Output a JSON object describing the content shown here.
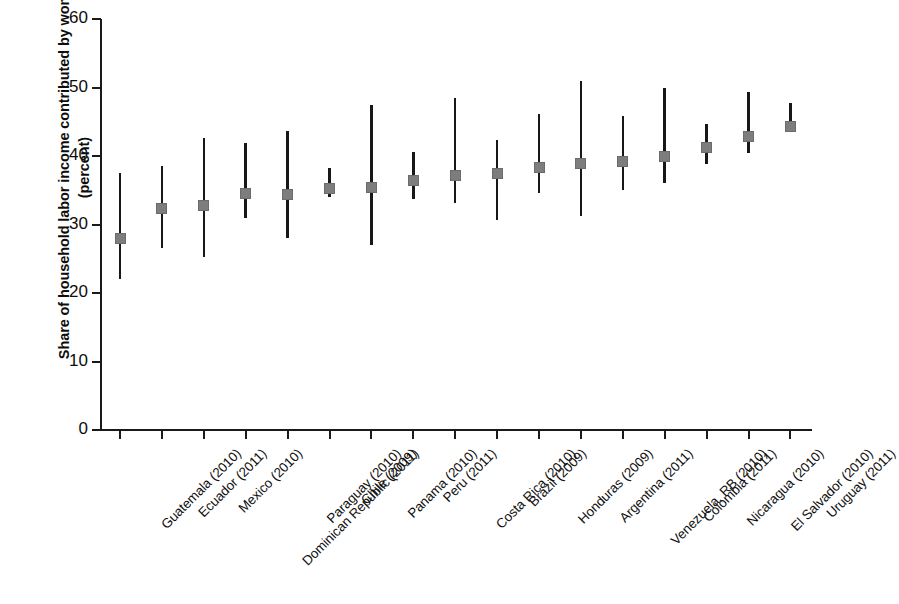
{
  "chart_data": {
    "type": "scatter",
    "title": "",
    "subtitle": "",
    "xlabel": "",
    "ylabel": "Share of household labor income contributed by women (percent)",
    "ylim": [
      0,
      60
    ],
    "ytick_labels": [
      "0",
      "10",
      "20",
      "30",
      "40",
      "50",
      "60"
    ],
    "yticks": [
      0,
      10,
      20,
      30,
      40,
      50,
      60
    ],
    "grid": false,
    "legend": null,
    "legend_position": "none",
    "annotations": [],
    "marker_style": "grey square with vertical range line",
    "categories": [
      "Guatemala (2010)",
      "Ecuador (2011)",
      "Mexico (2010)",
      "Dominican Republic (2011)",
      "Paraguay (2010)",
      "Chile (2009)",
      "Panama (2010)",
      "Peru (2011)",
      "Costa Rica (2010)",
      "Brazil (2009)",
      "Honduras (2009)",
      "Argentina (2011)",
      "Venezuela, RB (2010)",
      "Colombia (2011)",
      "Nicaragua (2010)",
      "El Salvador (2010)",
      "Uruguay (2011)"
    ],
    "series": [
      {
        "name": "Mean share",
        "values": [
          28.0,
          32.3,
          32.8,
          34.5,
          34.4,
          35.2,
          35.4,
          36.4,
          37.2,
          37.4,
          38.3,
          38.9,
          39.2,
          39.9,
          41.3,
          42.8,
          44.3
        ]
      },
      {
        "name": "Range low",
        "values": [
          22.0,
          26.5,
          25.3,
          30.9,
          28.1,
          34.0,
          27.0,
          33.7,
          33.1,
          30.6,
          34.6,
          31.3,
          35.0,
          36.0,
          38.8,
          40.5,
          43.5
        ]
      },
      {
        "name": "Range high",
        "values": [
          37.5,
          38.6,
          42.7,
          41.9,
          43.6,
          38.3,
          47.4,
          40.6,
          48.4,
          42.3,
          46.1,
          51.0,
          45.8,
          49.9,
          44.7,
          49.3,
          47.7
        ]
      }
    ],
    "colors": {
      "marker": "#7d7d7d",
      "line": "#171717",
      "axis": "#1a1a1a",
      "background": "#ffffff"
    }
  }
}
